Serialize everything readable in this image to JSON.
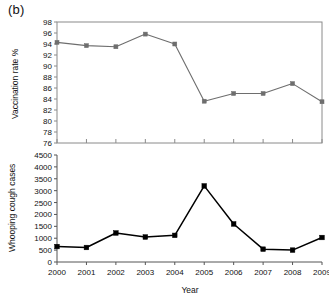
{
  "figure": {
    "panel_label": "(b)",
    "xlabel": "Year"
  },
  "chart_data": [
    {
      "type": "line",
      "panel": "(b) top",
      "title": "",
      "xlabel": "Year",
      "ylabel": "Vaccination rate %",
      "categories": [
        "2000",
        "2001",
        "2002",
        "2003",
        "2004",
        "2005",
        "2006",
        "2007",
        "2008",
        "2009"
      ],
      "x": [
        2000,
        2001,
        2002,
        2003,
        2004,
        2005,
        2006,
        2007,
        2008,
        2009
      ],
      "values": [
        94.3,
        93.7,
        93.5,
        95.8,
        94.0,
        83.6,
        85.0,
        85.0,
        86.8,
        83.5
      ],
      "ylim": [
        76,
        98
      ],
      "yticks": [
        76,
        78,
        80,
        82,
        84,
        86,
        88,
        90,
        92,
        94,
        96,
        98
      ],
      "ytick_labels": [
        "76",
        "78",
        "80",
        "82",
        "84",
        "86",
        "88",
        "90",
        "92",
        "94",
        "96",
        "98"
      ],
      "xtick_labels": [],
      "grid": false,
      "legend": null,
      "series_color": "#6e6e6e",
      "marker": "square",
      "frame": "box"
    },
    {
      "type": "line",
      "panel": "(b) bottom",
      "title": "",
      "xlabel": "Year",
      "ylabel": "Whooping cough cases",
      "categories": [
        "2000",
        "2001",
        "2002",
        "2003",
        "2004",
        "2005",
        "2006",
        "2007",
        "2008",
        "2009"
      ],
      "x": [
        2000,
        2001,
        2002,
        2003,
        2004,
        2005,
        2006,
        2007,
        2008,
        2009
      ],
      "values": [
        650,
        610,
        1220,
        1050,
        1120,
        3200,
        1600,
        540,
        500,
        1030
      ],
      "ylim": [
        0,
        4500
      ],
      "yticks": [
        0,
        500,
        1000,
        1500,
        2000,
        2500,
        3000,
        3500,
        4000,
        4500
      ],
      "ytick_labels": [
        "0",
        "500",
        "1000",
        "1500",
        "2000",
        "2500",
        "3000",
        "3500",
        "4000",
        "4500"
      ],
      "xtick_labels": [
        "2000",
        "2001",
        "2002",
        "2003",
        "2004",
        "2005",
        "2006",
        "2007",
        "2008",
        "2009"
      ],
      "grid": false,
      "legend": null,
      "series_color": "#000000",
      "marker": "square",
      "frame": "left-bottom"
    }
  ]
}
